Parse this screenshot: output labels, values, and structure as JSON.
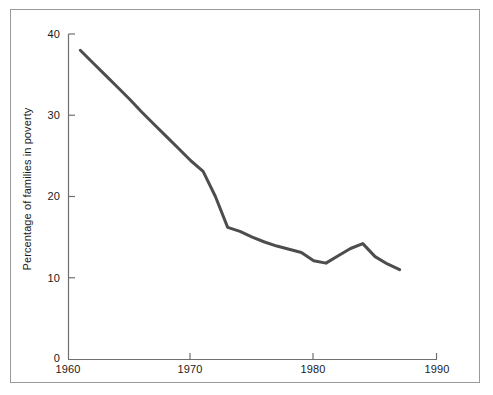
{
  "chart_data": {
    "type": "line",
    "title": "",
    "xlabel": "",
    "ylabel": "Percentage of families in poverty",
    "xlim": [
      1960,
      1990
    ],
    "ylim": [
      0,
      40
    ],
    "grid": false,
    "legend": null,
    "xticks": [
      "1960",
      "1970",
      "1980",
      "1990"
    ],
    "xtick_values": [
      1960,
      1970,
      1980,
      1990
    ],
    "yticks": [
      "0",
      "10",
      "20",
      "30",
      "40"
    ],
    "ytick_values": [
      0,
      10,
      20,
      30,
      40
    ],
    "line_color": "#4d4d4d",
    "line_width": 3,
    "series": [
      {
        "name": "Percentage of families in poverty",
        "x": [
          1961,
          1962,
          1963,
          1964,
          1965,
          1966,
          1967,
          1968,
          1969,
          1970,
          1971,
          1972,
          1973,
          1974,
          1975,
          1976,
          1977,
          1978,
          1979,
          1980,
          1981,
          1982,
          1983,
          1984,
          1985,
          1986,
          1987
        ],
        "values": [
          38.0,
          36.5,
          35.0,
          33.5,
          32.0,
          30.4,
          28.9,
          27.4,
          25.9,
          24.4,
          23.1,
          20.0,
          16.2,
          15.7,
          15.0,
          14.4,
          13.9,
          13.5,
          13.1,
          12.1,
          11.8,
          12.7,
          13.6,
          14.2,
          12.6,
          11.7,
          11.0
        ]
      }
    ]
  },
  "axes": {
    "ytick_0": "0",
    "ytick_10": "10",
    "ytick_20": "20",
    "ytick_30": "30",
    "ytick_40": "40",
    "xtick_1960": "1960",
    "xtick_1970": "1970",
    "xtick_1980": "1980",
    "xtick_1990": "1990",
    "y_axis_title": "Percentage of families in poverty"
  }
}
